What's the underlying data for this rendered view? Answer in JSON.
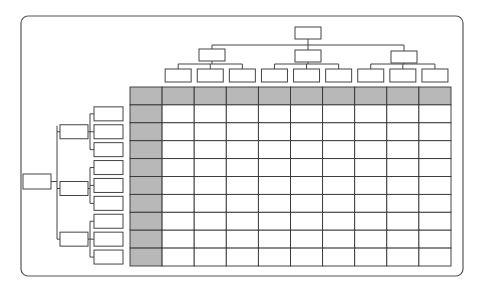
{
  "diagram": {
    "title": "",
    "frame": {
      "x": 21,
      "y": 16,
      "width": 442,
      "height": 260,
      "radius": 7
    },
    "colors": {
      "header_fill": "#b8b8b8",
      "cell_fill": "#ffffff",
      "line": "#333333"
    },
    "matrix": {
      "x": 130,
      "y": 87,
      "cols": 10,
      "rows": 10,
      "col_width": 32.1,
      "row_height": 17.9,
      "header_row": true,
      "header_col": true
    },
    "top_tree": {
      "root": {
        "x": 295,
        "y": 27,
        "w": 26,
        "h": 12
      },
      "level1_bar_y": 45,
      "level1": [
        {
          "x": 199,
          "y": 49,
          "w": 26,
          "h": 12
        },
        {
          "x": 295,
          "y": 50,
          "w": 26,
          "h": 12
        },
        {
          "x": 391,
          "y": 51,
          "w": 26,
          "h": 12
        }
      ],
      "level2_bar_offset": 5,
      "level2_y": 69,
      "level2_w": 26,
      "level2_h": 13
    },
    "left_tree": {
      "root": {
        "x": 23,
        "y": 174,
        "w": 28,
        "h": 15
      },
      "level1_x": 60,
      "level1_w": 28,
      "level1_h": 14,
      "level1_bar_x": 57,
      "level2_x": 94,
      "level2_w": 29,
      "level2_h": 14,
      "level2_bar_offset": 4
    },
    "labels": []
  }
}
